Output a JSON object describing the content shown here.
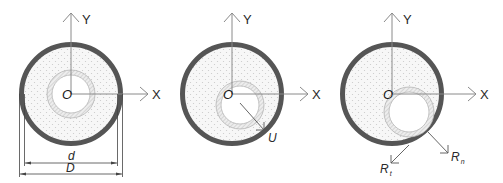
{
  "figure": {
    "colors": {
      "outer_wall": "#555555",
      "axis": "#8a8a8a",
      "filler_dots": "#c9c9c9",
      "ring_hatch": "#bdbdbd",
      "background": "#ffffff"
    },
    "panels": [
      {
        "id": "concentric",
        "axis_y_label": "Y",
        "axis_x_label": "X",
        "origin_label": "O",
        "dimensions": {
          "inner_diameter_label": "d",
          "outer_diameter_label": "D"
        }
      },
      {
        "id": "eccentric",
        "axis_y_label": "Y",
        "axis_x_label": "X",
        "origin_label": "O",
        "displacement_label": "U"
      },
      {
        "id": "contact",
        "axis_y_label": "Y",
        "axis_x_label": "X",
        "origin_label": "O",
        "force_tangential_label": "R",
        "force_tangential_sub": "t",
        "force_normal_label": "R",
        "force_normal_sub": "n"
      }
    ]
  }
}
